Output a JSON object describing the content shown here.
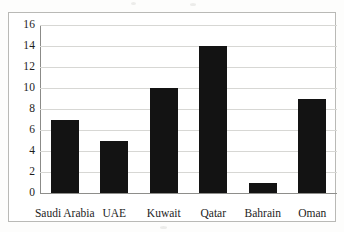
{
  "chart_data": {
    "type": "bar",
    "title": "",
    "xlabel": "",
    "ylabel": "",
    "categories": [
      "Saudi Arabia",
      "UAE",
      "Kuwait",
      "Qatar",
      "Bahrain",
      "Oman"
    ],
    "values": [
      7,
      5,
      10,
      14,
      1,
      9
    ],
    "ylim": [
      0,
      16
    ],
    "ytick_step": 2,
    "yticks": [
      0,
      2,
      4,
      6,
      8,
      10,
      12,
      14,
      16
    ],
    "ytick_labels": [
      "0",
      "2",
      "4",
      "6",
      "8",
      "10",
      "12",
      "14",
      "16"
    ],
    "grid": true,
    "grid_axis": "y",
    "legend": false,
    "legend_position": "none",
    "bar_color": "#131313",
    "grid_color": "#d7d7d4",
    "axis_color": "#8b8b88",
    "frame_color": "#b9b9b6",
    "background_color": "#ffffff"
  }
}
